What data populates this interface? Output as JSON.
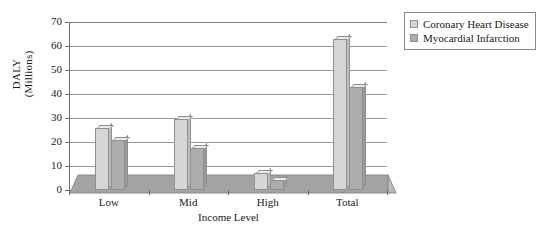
{
  "chart_data": {
    "type": "bar",
    "title": "",
    "xlabel": "Income Level",
    "ylabel": "DALY (Millions)",
    "ylabel_line1": "DALY",
    "ylabel_line2": "(Millions)",
    "categories": [
      "Low",
      "Mid",
      "High",
      "Total"
    ],
    "series": [
      {
        "name": "Coronary Heart Disease",
        "color": "#d6d6d6",
        "values": [
          26,
          29.5,
          7,
          63
        ]
      },
      {
        "name": "Myocardial Infarction",
        "color": "#adadad",
        "values": [
          21,
          17.5,
          4,
          43
        ]
      }
    ],
    "ylim": [
      0,
      70
    ],
    "yticks": [
      0,
      10,
      20,
      30,
      40,
      50,
      60,
      70
    ],
    "ytick_labels": [
      "0",
      "10",
      "20",
      "30",
      "40",
      "50",
      "60",
      "70"
    ],
    "grid": true,
    "grid_axis": "y",
    "legend_position": "right-top",
    "style_3d": true,
    "floor_band_value": 4.5
  },
  "legend": {
    "items": [
      {
        "label": "Coronary Heart Disease",
        "color": "#d6d6d6"
      },
      {
        "label": "Myocardial Infarction",
        "color": "#adadad"
      }
    ]
  },
  "colors": {
    "series_light": "#d6d6d6",
    "series_dark": "#adadad",
    "floor": "#a3a3a3",
    "axis": "#6e6e6e",
    "grid": "#9a9a9a",
    "text": "#1a1a1a",
    "background": "#ffffff"
  }
}
